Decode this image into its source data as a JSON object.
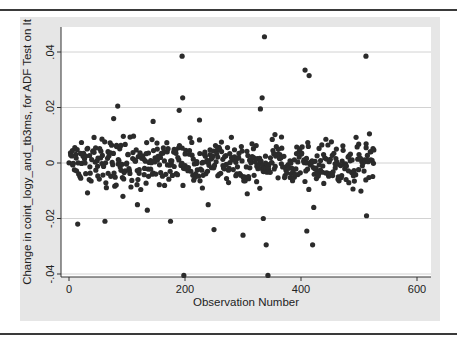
{
  "chart_data": {
    "type": "scatter",
    "title": "",
    "xlabel": "Observation Number",
    "ylabel": "Change in coint_logy_and_tb3ms, for ADF Test on It",
    "xlim": [
      -5,
      620
    ],
    "ylim": [
      -0.0415,
      0.0475
    ],
    "xticks": [
      0,
      200,
      400,
      600
    ],
    "xtick_labels": [
      "0",
      "200",
      "400",
      "600"
    ],
    "yticks": [
      -0.04,
      -0.02,
      0,
      0.02,
      0.04
    ],
    "ytick_labels": [
      "-.04",
      "-.02",
      "0",
      ".02",
      ".04"
    ],
    "grid": "horizontal at y ticks",
    "legend": "none",
    "marker_color": "#2b2b2b",
    "n_observations_approx": 527,
    "outliers": [
      {
        "x": 15,
        "y": -0.022
      },
      {
        "x": 62,
        "y": -0.021
      },
      {
        "x": 77,
        "y": 0.016
      },
      {
        "x": 84,
        "y": 0.0205
      },
      {
        "x": 135,
        "y": -0.017
      },
      {
        "x": 145,
        "y": 0.015
      },
      {
        "x": 175,
        "y": -0.021
      },
      {
        "x": 190,
        "y": 0.019
      },
      {
        "x": 195,
        "y": 0.0385
      },
      {
        "x": 196,
        "y": 0.0235
      },
      {
        "x": 198,
        "y": -0.0405
      },
      {
        "x": 240,
        "y": -0.015
      },
      {
        "x": 250,
        "y": -0.024
      },
      {
        "x": 300,
        "y": -0.026
      },
      {
        "x": 330,
        "y": 0.0195
      },
      {
        "x": 333,
        "y": 0.0235
      },
      {
        "x": 335,
        "y": -0.02
      },
      {
        "x": 337,
        "y": 0.0455
      },
      {
        "x": 340,
        "y": -0.0295
      },
      {
        "x": 343,
        "y": -0.0405
      },
      {
        "x": 407,
        "y": 0.0335
      },
      {
        "x": 414,
        "y": 0.0315
      },
      {
        "x": 410,
        "y": -0.0245
      },
      {
        "x": 420,
        "y": -0.0295
      },
      {
        "x": 422,
        "y": -0.016
      },
      {
        "x": 512,
        "y": 0.0385
      },
      {
        "x": 513,
        "y": -0.019
      },
      {
        "x": 518,
        "y": 0.0105
      },
      {
        "x": 225,
        "y": 0.0155
      },
      {
        "x": 230,
        "y": -0.009
      },
      {
        "x": 118,
        "y": -0.015
      },
      {
        "x": 93,
        "y": -0.012
      }
    ],
    "core_cloud": {
      "description": "dense band of ~495 points, obs 1-527, mostly within -0.012 to +0.014, centered near 0",
      "seed": 7,
      "count": 495,
      "x_range": [
        1,
        527
      ],
      "y_sd": 0.0055,
      "y_clip": [
        -0.014,
        0.016
      ]
    }
  }
}
